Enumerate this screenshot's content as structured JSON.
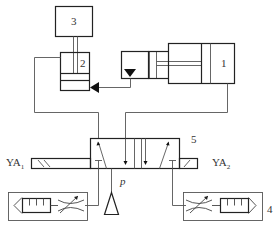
{
  "diagram": {
    "type": "hydraulic circuit schematic",
    "components": [
      {
        "id": "1",
        "label": "1",
        "kind": "double-acting hydraulic cylinder"
      },
      {
        "id": "2",
        "label": "2",
        "kind": "hydraulic cylinder"
      },
      {
        "id": "3",
        "label": "3",
        "kind": "load block"
      },
      {
        "id": "4",
        "label": "4",
        "kind": "adjustable throttle + filter assembly"
      },
      {
        "id": "5",
        "label": "5",
        "kind": "solenoid directional control valve"
      }
    ],
    "labels": {
      "c1": "1",
      "c2": "2",
      "c3": "3",
      "c4": "4",
      "c5": "5",
      "ya1_main": "YA",
      "ya1_sub": "1",
      "ya2_main": "YA",
      "ya2_sub": "2",
      "pressure": "p"
    },
    "colors": {
      "line": "#222222",
      "thin_line": "#555555",
      "background": "#ffffff"
    }
  }
}
